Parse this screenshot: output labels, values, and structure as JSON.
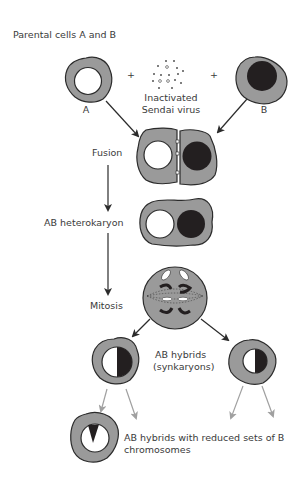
{
  "diagram": {
    "title": "Parental cells A and B",
    "parents": {
      "cell_a_label": "A",
      "cell_b_label": "B",
      "plus_1": "+",
      "plus_2": "+",
      "virus_label_line1": "Inactivated",
      "virus_label_line2": "Sendai virus"
    },
    "steps": {
      "fusion": "Fusion",
      "heterokaryon": "AB heterokaryon",
      "mitosis": "Mitosis",
      "hybrids_line1": "AB hybrids",
      "hybrids_line2": "(synkaryons)",
      "reduced_line1": "AB hybrids with reduced sets of B",
      "reduced_line2": "chromosomes"
    },
    "colors": {
      "cytoplasm": "#9a9a9a",
      "outline": "#2b2b2b",
      "nucleus_a": "#ffffff",
      "nucleus_b": "#231f20",
      "arrow_dark": "#2b2b2b",
      "arrow_light": "#a0a0a0"
    }
  }
}
